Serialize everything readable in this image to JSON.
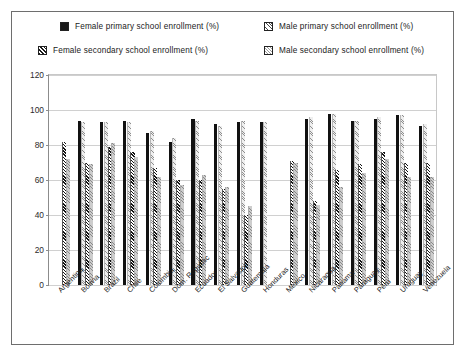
{
  "chart_data": {
    "type": "bar",
    "title": "",
    "xlabel": "",
    "ylabel": "",
    "ylim": [
      0,
      120
    ],
    "ytick_step": 20,
    "yticks": [
      "0",
      "20",
      "40",
      "60",
      "80",
      "100",
      "120"
    ],
    "grid": true,
    "legend_position": "top",
    "categories": [
      "Argentina",
      "Bolivia",
      "Brazil",
      "Chile",
      "Colombia",
      "Dom. Republic",
      "Ecuador",
      "El Salvador",
      "Guatemala",
      "Honduras",
      "Mexico",
      "Nicaragua",
      "Panama",
      "Paraguay",
      "Peru",
      "Uruguay",
      "Venezuela"
    ],
    "series": [
      {
        "name": "Female primary school enrollment (%)",
        "pattern": "solid-black",
        "color": "#111111",
        "values": [
          null,
          94,
          93,
          94,
          87,
          82,
          95,
          92,
          93,
          93,
          null,
          95,
          98,
          94,
          95,
          97,
          91
        ]
      },
      {
        "name": "Male primary school enrollment (%)",
        "pattern": "light-hatch",
        "color": "#efefef",
        "values": [
          null,
          93,
          93,
          93,
          88,
          84,
          94,
          91,
          94,
          93,
          null,
          96,
          98,
          94,
          96,
          97,
          92
        ]
      },
      {
        "name": "Female secondary school enrollment (%)",
        "pattern": "dark-diagonal-hatch",
        "color": "#141414",
        "values": [
          82,
          70,
          79,
          76,
          67,
          60,
          60,
          55,
          40,
          null,
          71,
          48,
          66,
          69,
          76,
          70,
          70
        ]
      },
      {
        "name": "Male secondary school enrollment (%)",
        "pattern": "grey-hatch",
        "color": "#cdcdcd",
        "values": [
          72,
          69,
          81,
          73,
          62,
          57,
          63,
          56,
          45,
          null,
          70,
          46,
          56,
          64,
          72,
          62,
          62
        ]
      }
    ]
  },
  "legend": {
    "items": [
      {
        "label": "Female primary school enrollment (%)",
        "swatch": "solid-black-swatch"
      },
      {
        "label": "Male primary school enrollment (%)",
        "swatch": "light-hatch-swatch"
      },
      {
        "label": "Female secondary school enrollment (%)",
        "swatch": "dark-hatch-swatch"
      },
      {
        "label": "Male secondary school enrollment (%)",
        "swatch": "grey-hatch-swatch"
      }
    ]
  }
}
